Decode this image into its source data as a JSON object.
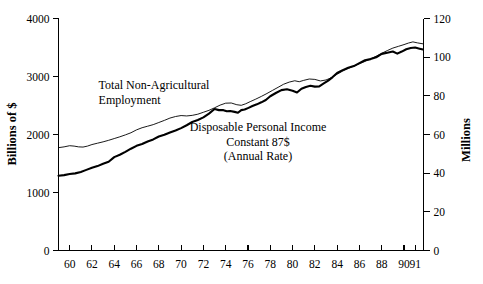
{
  "chart_data": {
    "type": "line",
    "title": "",
    "subtitle": "",
    "xlabel": "",
    "ylabel": "Billions of $",
    "y2label": "Millions",
    "grid": false,
    "legend": "inline-annotations",
    "xlim": [
      1959.0,
      1991.75
    ],
    "ylim": [
      0,
      4000
    ],
    "y2lim": [
      0,
      120
    ],
    "x_ticks": [
      "60",
      "62",
      "64",
      "66",
      "68",
      "70",
      "72",
      "74",
      "76",
      "78",
      "80",
      "82",
      "84",
      "86",
      "88",
      "90",
      "91"
    ],
    "x_tick_values": [
      1960,
      1962,
      1964,
      1966,
      1968,
      1970,
      1972,
      1974,
      1976,
      1978,
      1980,
      1982,
      1984,
      1986,
      1988,
      1990,
      1991
    ],
    "y_ticks": [
      "0",
      "1000",
      "2000",
      "3000",
      "4000"
    ],
    "y_tick_values": [
      0,
      1000,
      2000,
      3000,
      4000
    ],
    "y2_ticks": [
      "0",
      "20",
      "40",
      "60",
      "80",
      "100",
      "120"
    ],
    "y2_tick_values": [
      0,
      20,
      40,
      60,
      80,
      100,
      120
    ],
    "annotations": [
      {
        "name": "employment-label",
        "lines": [
          "Total Non-Agricultural",
          "Employment"
        ],
        "x": 1962.6,
        "y": 2780
      },
      {
        "name": "income-label",
        "lines": [
          "Disposable Personal Income",
          "Constant 87$",
          "(Annual Rate)"
        ],
        "x": 1976.9,
        "y": 2060
      }
    ],
    "series": [
      {
        "name": "Total Non-Agricultural Employment",
        "axis": "right",
        "units": "Millions",
        "style": "thin",
        "color": "#000000",
        "x": [
          1959.0,
          1959.5,
          1960.0,
          1960.4,
          1960.8,
          1961.2,
          1961.6,
          1962.0,
          1962.5,
          1963.0,
          1963.5,
          1964.0,
          1964.5,
          1965.0,
          1965.5,
          1966.0,
          1966.5,
          1967.0,
          1967.5,
          1968.0,
          1968.5,
          1969.0,
          1969.5,
          1970.0,
          1970.5,
          1971.0,
          1971.5,
          1972.0,
          1972.5,
          1973.0,
          1973.5,
          1974.0,
          1974.5,
          1975.0,
          1975.4,
          1975.8,
          1976.2,
          1976.7,
          1977.2,
          1977.7,
          1978.2,
          1978.7,
          1979.2,
          1979.7,
          1980.2,
          1980.6,
          1981.0,
          1981.5,
          1982.0,
          1982.5,
          1983.0,
          1983.5,
          1984.0,
          1984.5,
          1985.0,
          1985.5,
          1986.0,
          1986.5,
          1987.0,
          1987.5,
          1988.0,
          1988.5,
          1989.0,
          1989.5,
          1990.0,
          1990.4,
          1990.8,
          1991.2,
          1991.7
        ],
        "y": [
          53.2,
          53.6,
          54.2,
          54.0,
          53.6,
          53.5,
          54.0,
          54.8,
          55.5,
          56.2,
          57.0,
          57.9,
          58.8,
          59.8,
          60.9,
          62.4,
          63.5,
          64.3,
          65.1,
          66.2,
          67.3,
          68.5,
          69.3,
          69.8,
          69.6,
          69.9,
          70.5,
          71.5,
          72.5,
          73.8,
          75.2,
          76.2,
          76.3,
          75.4,
          75.1,
          75.9,
          77.0,
          78.3,
          79.7,
          81.2,
          82.8,
          84.4,
          86.0,
          87.1,
          87.8,
          87.3,
          88.0,
          88.7,
          88.5,
          87.7,
          88.2,
          89.4,
          91.2,
          92.8,
          94.2,
          95.4,
          96.6,
          97.8,
          99.1,
          100.5,
          102.0,
          103.4,
          104.7,
          105.6,
          106.5,
          107.3,
          107.9,
          107.4,
          106.9
        ]
      },
      {
        "name": "Disposable Personal Income Constant 87$",
        "axis": "left",
        "units": "Billions of $",
        "style": "thick",
        "color": "#000000",
        "x": [
          1959.0,
          1959.5,
          1960.0,
          1960.5,
          1961.0,
          1961.5,
          1962.0,
          1962.5,
          1963.0,
          1963.5,
          1964.0,
          1964.5,
          1965.0,
          1965.5,
          1966.0,
          1966.5,
          1967.0,
          1967.5,
          1968.0,
          1968.5,
          1969.0,
          1969.5,
          1970.0,
          1970.5,
          1971.0,
          1971.5,
          1972.0,
          1972.5,
          1973.0,
          1973.4,
          1973.8,
          1974.1,
          1974.4,
          1974.8,
          1975.1,
          1975.4,
          1975.7,
          1976.0,
          1976.4,
          1976.8,
          1977.2,
          1977.6,
          1978.0,
          1978.5,
          1979.0,
          1979.5,
          1980.0,
          1980.4,
          1980.8,
          1981.2,
          1981.6,
          1982.0,
          1982.4,
          1982.8,
          1983.2,
          1983.6,
          1984.0,
          1984.5,
          1985.0,
          1985.5,
          1986.0,
          1986.5,
          1987.0,
          1987.5,
          1988.0,
          1988.5,
          1989.0,
          1989.4,
          1989.8,
          1990.2,
          1990.6,
          1991.0,
          1991.4,
          1991.7
        ],
        "y": [
          1290,
          1300,
          1320,
          1330,
          1355,
          1390,
          1425,
          1455,
          1495,
          1530,
          1610,
          1650,
          1700,
          1755,
          1805,
          1835,
          1880,
          1915,
          1965,
          1995,
          2035,
          2070,
          2110,
          2160,
          2215,
          2250,
          2295,
          2360,
          2440,
          2420,
          2420,
          2400,
          2405,
          2390,
          2375,
          2420,
          2430,
          2455,
          2490,
          2520,
          2555,
          2595,
          2660,
          2715,
          2765,
          2780,
          2755,
          2725,
          2790,
          2820,
          2840,
          2825,
          2830,
          2880,
          2930,
          2990,
          3060,
          3110,
          3150,
          3180,
          3230,
          3280,
          3300,
          3330,
          3390,
          3410,
          3430,
          3395,
          3430,
          3470,
          3490,
          3500,
          3480,
          3465
        ]
      }
    ]
  }
}
